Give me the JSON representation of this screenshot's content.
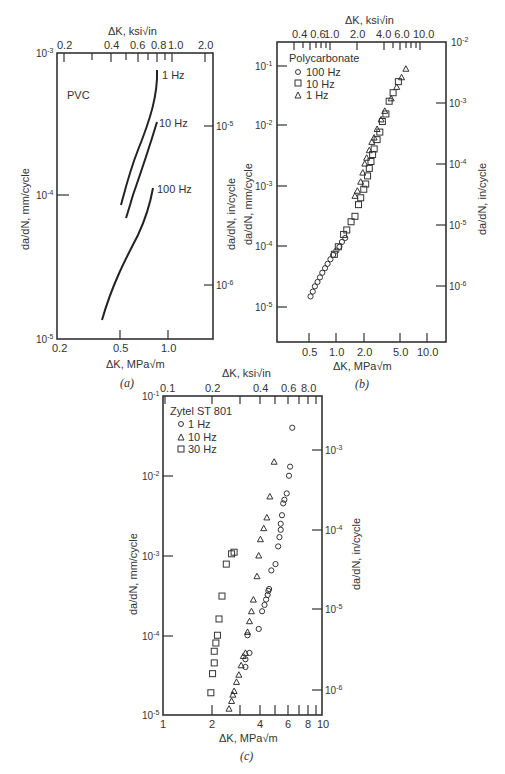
{
  "chart_data": [
    {
      "id": "a",
      "type": "line",
      "caption": "(a)",
      "material": "PVC",
      "xlabel_bottom": "ΔK, MPa√m",
      "xlabel_top": "ΔK, ksi√in",
      "ylabel_left": "da/dN, mm/cycle",
      "ylabel_right": "da/dN, in/cycle",
      "x_scale": "log",
      "y_scale": "log",
      "xlim": [
        0.2,
        1.9
      ],
      "ylim": [
        1e-05,
        0.001
      ],
      "bottom_ticks": [
        "0.2",
        "0.5",
        "1.0"
      ],
      "top_ticks": [
        "0.2",
        "0.4",
        "0.6",
        "0.8",
        "1.0",
        "2.0"
      ],
      "left_ticks": [
        "10^-3",
        "10^-4",
        "10^-5"
      ],
      "right_ticks": [
        "10^-5",
        "10^-6"
      ],
      "series": [
        {
          "name": "1 Hz",
          "x": [
            0.52,
            0.58,
            0.66,
            0.74,
            0.78,
            0.8
          ],
          "y": [
            0.00011,
            0.00018,
            0.0003,
            0.0005,
            0.0007,
            0.0009
          ]
        },
        {
          "name": "10 Hz",
          "x": [
            0.55,
            0.62,
            0.7,
            0.76,
            0.8
          ],
          "y": [
            8e-05,
            0.00012,
            0.0002,
            0.00032,
            0.00043
          ]
        },
        {
          "name": "100 Hz",
          "x": [
            0.37,
            0.42,
            0.5,
            0.6,
            0.7,
            0.78,
            0.82
          ],
          "y": [
            1.3e-05,
            1.9e-05,
            3e-05,
            4.7e-05,
            6.8e-05,
            9e-05,
            0.000115
          ]
        }
      ]
    },
    {
      "id": "b",
      "type": "scatter",
      "caption": "(b)",
      "material": "Polycarbonate",
      "xlabel_bottom": "ΔK, MPa√m",
      "xlabel_top": "ΔK, ksi√in",
      "ylabel_left": "da/dN, mm/cycle",
      "ylabel_right": "da/dN, in/cycle",
      "x_scale": "log",
      "y_scale": "log",
      "xlim": [
        0.25,
        16
      ],
      "ylim": [
        3e-06,
        0.3
      ],
      "bottom_ticks": [
        "0.5",
        "1.0",
        "2.0",
        "5.0",
        "10.0"
      ],
      "top_ticks": [
        "0.4",
        "0.6",
        "1.0",
        "2.0",
        "4.0",
        "6.0",
        "10.0"
      ],
      "left_ticks": [
        "10^-1",
        "10^-2",
        "10^-3",
        "10^-4",
        "10^-5"
      ],
      "right_ticks": [
        "10^-2",
        "10^-3",
        "10^-4",
        "10^-5",
        "10^-6"
      ],
      "series": [
        {
          "name": "100 Hz",
          "marker": "circle",
          "x": [
            0.52,
            0.55,
            0.58,
            0.62,
            0.66,
            0.7,
            0.75,
            0.8,
            0.86,
            0.92,
            1.0,
            1.08,
            1.15,
            1.25
          ],
          "y": [
            1.5e-05,
            1.8e-05,
            2.2e-05,
            2.6e-05,
            3.1e-05,
            3.7e-05,
            4.4e-05,
            5.2e-05,
            6.2e-05,
            7.3e-05,
            8.6e-05,
            0.0001,
            0.00012,
            0.00014
          ]
        },
        {
          "name": "10 Hz",
          "marker": "square",
          "x": [
            0.95,
            1.05,
            1.2,
            1.3,
            1.45,
            1.6,
            1.75,
            1.85,
            2.0,
            2.1,
            2.2,
            2.3,
            2.4,
            2.5,
            2.6,
            2.8,
            3.0,
            3.2,
            3.5,
            3.8,
            4.2,
            4.8
          ],
          "y": [
            7.5e-05,
            0.0001,
            0.00016,
            0.00019,
            0.00026,
            0.00032,
            0.0005,
            0.00065,
            0.0009,
            0.0011,
            0.0015,
            0.002,
            0.0026,
            0.0034,
            0.0042,
            0.006,
            0.008,
            0.012,
            0.016,
            0.026,
            0.036,
            0.055
          ]
        },
        {
          "name": "1 Hz",
          "marker": "triangle",
          "x": [
            1.6,
            1.7,
            1.85,
            1.95,
            2.05,
            2.15,
            2.3,
            2.45,
            2.6,
            2.8,
            3.1,
            3.4,
            4.0,
            4.6,
            5.2,
            5.8
          ],
          "y": [
            0.0007,
            0.00085,
            0.0012,
            0.0017,
            0.0024,
            0.003,
            0.004,
            0.0055,
            0.0065,
            0.009,
            0.013,
            0.018,
            0.029,
            0.045,
            0.065,
            0.09
          ]
        }
      ]
    },
    {
      "id": "c",
      "type": "scatter",
      "caption": "(c)",
      "material": "Zytel ST 801",
      "xlabel_bottom": "ΔK, MPa√m",
      "xlabel_top": "ΔK, ksi√in",
      "ylabel_left": "da/dN, mm/cycle",
      "ylabel_right": "da/dN, in/cycle",
      "x_scale": "log",
      "y_scale": "log",
      "xlim": [
        1,
        10
      ],
      "ylim": [
        1e-05,
        0.1
      ],
      "bottom_ticks": [
        "1",
        "2",
        "4",
        "6",
        "8",
        "10"
      ],
      "top_ticks": [
        "0.1",
        "0.2",
        "0.4",
        "0.6",
        "8.0"
      ],
      "left_ticks": [
        "10^-1",
        "10^-2",
        "10^-3",
        "10^-4",
        "10^-5"
      ],
      "right_ticks": [
        "10^-3",
        "10^-4",
        "10^-5",
        "10^-6"
      ],
      "series": [
        {
          "name": "1 Hz",
          "marker": "circle",
          "x": [
            3.3,
            3.3,
            3.5,
            3.4,
            4.0,
            4.2,
            4.35,
            4.45,
            4.55,
            4.6,
            4.65,
            4.8,
            5.1,
            5.3,
            5.4,
            5.5,
            5.5,
            5.6,
            5.7,
            5.8,
            6.0,
            6.2,
            6.3,
            6.5
          ],
          "y": [
            4e-05,
            5e-05,
            6e-05,
            0.0001,
            0.00012,
            0.0002,
            0.00024,
            0.00028,
            0.00032,
            0.00036,
            0.00038,
            0.00065,
            0.00078,
            0.0013,
            0.0017,
            0.0021,
            0.0025,
            0.0032,
            0.0045,
            0.005,
            0.006,
            0.01,
            0.013,
            0.04
          ]
        },
        {
          "name": "10 Hz",
          "marker": "triangle",
          "x": [
            2.6,
            2.7,
            2.75,
            2.8,
            2.9,
            3.0,
            3.1,
            3.2,
            3.3,
            3.4,
            3.5,
            3.6,
            3.7,
            3.9,
            4.0,
            4.1,
            4.3,
            4.5,
            4.7,
            5.0
          ],
          "y": [
            1.2e-05,
            1.5e-05,
            1.8e-05,
            2e-05,
            2.6e-05,
            3.2e-05,
            4.2e-05,
            5.5e-05,
            6e-05,
            0.00011,
            0.00015,
            0.0002,
            0.00028,
            0.00055,
            0.001,
            0.0016,
            0.0022,
            0.003,
            0.0055,
            0.015
          ]
        },
        {
          "name": "30 Hz",
          "marker": "square",
          "x": [
            2.0,
            2.05,
            2.1,
            2.1,
            2.15,
            2.2,
            2.25,
            2.35,
            2.5,
            2.7,
            2.8
          ],
          "y": [
            1.9e-05,
            3.3e-05,
            4.5e-05,
            6.3e-05,
            8e-05,
            0.0001,
            0.00016,
            0.00031,
            0.00078,
            0.00105,
            0.0011
          ]
        }
      ]
    }
  ],
  "panels": {
    "a": {
      "caption": "(a)",
      "material": "PVC",
      "xlabel_bottom": "ΔK, MPa√m",
      "xlabel_top": "ΔK, ksi√in",
      "ylabel_left": "da/dN, mm/cycle",
      "ylabel_right": "da/dN, in/cycle",
      "curve_labels": [
        "1 Hz",
        "10 Hz",
        "100 Hz"
      ]
    },
    "b": {
      "caption": "(b)",
      "material": "Polycarbonate",
      "xlabel_bottom": "ΔK, MPa√m",
      "xlabel_top": "ΔK, ksi√in",
      "ylabel_left": "da/dN, mm/cycle",
      "ylabel_right": "da/dN, in/cycle",
      "legend": [
        "100 Hz",
        "10 Hz",
        "1 Hz"
      ]
    },
    "c": {
      "caption": "(c)",
      "material": "Zytel ST 801",
      "xlabel_bottom": "ΔK, MPa√m",
      "xlabel_top": "ΔK, ksi√in",
      "ylabel_left": "da/dN, mm/cycle",
      "ylabel_right": "da/dN, in/cycle",
      "legend": [
        "1 Hz",
        "10 Hz",
        "30 Hz"
      ]
    }
  }
}
